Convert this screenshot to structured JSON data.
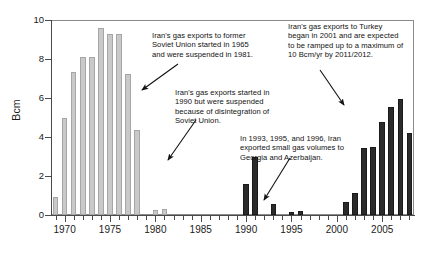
{
  "chart_data": {
    "type": "bar",
    "title": "",
    "xlabel": "",
    "ylabel": "Bcm",
    "ylim": [
      0,
      10
    ],
    "yticks": [
      0,
      2,
      4,
      6,
      8,
      10
    ],
    "xlim": [
      1968.5,
      2008.5
    ],
    "xticks": [
      1970,
      1975,
      1980,
      1985,
      1990,
      1995,
      2000,
      2005
    ],
    "xtick_labels": [
      "1970",
      "1975",
      "1980",
      "1985",
      "1990",
      "1995",
      "2000",
      "2005"
    ],
    "grid": false,
    "legend": "none",
    "categories": [
      1969,
      1970,
      1971,
      1972,
      1973,
      1974,
      1975,
      1976,
      1977,
      1978,
      1979,
      1980,
      1981,
      1982,
      1983,
      1984,
      1985,
      1986,
      1987,
      1988,
      1989,
      1990,
      1991,
      1992,
      1993,
      1994,
      1995,
      1996,
      1997,
      1998,
      1999,
      2000,
      2001,
      2002,
      2003,
      2004,
      2005,
      2006,
      2007,
      2008
    ],
    "values": [
      0.9,
      5.0,
      7.35,
      8.1,
      8.1,
      9.6,
      9.3,
      9.3,
      7.25,
      4.35,
      0.0,
      0.25,
      0.3,
      0.0,
      0.0,
      0.0,
      0.0,
      0.0,
      0.0,
      0.0,
      0.0,
      1.6,
      3.0,
      0.0,
      0.55,
      0.0,
      0.15,
      0.2,
      0.0,
      0.0,
      0.0,
      0.0,
      0.65,
      1.15,
      3.45,
      3.5,
      4.75,
      5.55,
      5.95,
      4.2
    ],
    "series_colors": {
      "soviet_era": "#c9c9c9",
      "modern_era": "#2b2b2b"
    },
    "bar_styles": [
      "light",
      "light",
      "light",
      "light",
      "light",
      "light",
      "light",
      "light",
      "light",
      "light",
      "light",
      "light",
      "light",
      "light",
      "light",
      "light",
      "light",
      "light",
      "light",
      "light",
      "light",
      "dark",
      "dark",
      "dark",
      "dark",
      "dark",
      "dark",
      "dark",
      "dark",
      "dark",
      "dark",
      "dark",
      "dark",
      "dark",
      "dark",
      "dark",
      "dark",
      "dark",
      "dark",
      "dark"
    ],
    "annotations": [
      {
        "id": "soviet-exports-note",
        "text": "Iran's gas exports to former Soviet Union started in 1965 and were suspended in 1981."
      },
      {
        "id": "nineties-suspension-note",
        "text": "Iran's gas exports started in 1990 but were suspended because of disintegration of Soviet Union."
      },
      {
        "id": "turkey-exports-note",
        "text": "Iran's gas exports  to Turkey began in 2001 and are expected to be ramped up to a maximum of 10 Bcm/yr by 2011/2012."
      },
      {
        "id": "georgia-azerbaijan-note",
        "text": "In 1993, 1995, and 1996, Iran exported  small gas volumes to Georgia and Azerbaijan."
      }
    ]
  },
  "axis": {
    "y_label": "Bcm",
    "y_ticks": [
      "0",
      "2",
      "4",
      "6",
      "8",
      "10"
    ],
    "x_ticks": [
      "1970",
      "1975",
      "1980",
      "1985",
      "1990",
      "1995",
      "2000",
      "2005"
    ]
  },
  "annotations": {
    "a": "Iran's gas exports to former Soviet Union started in 1965 and were suspended in 1981.",
    "b": "Iran's gas exports started in 1990 but were suspended because of disintegration of Soviet Union.",
    "c": "Iran's gas exports  to Turkey began in 2001 and are expected to be ramped up to a maximum of 10 Bcm/yr by 2011/2012.",
    "d": "In 1993, 1995, and 1996, Iran exported  small gas volumes to Georgia and Azerbaijan."
  }
}
